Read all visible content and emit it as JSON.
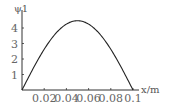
{
  "chart_data": {
    "type": "line",
    "title": "",
    "xlabel": "x/m",
    "ylabel": "ψ1",
    "xlim": [
      0,
      0.1
    ],
    "ylim": [
      0,
      4.6
    ],
    "x_ticks": [
      "0.02",
      "0.04",
      "0.06",
      "0.08",
      "0.1"
    ],
    "y_ticks": [
      "1",
      "2",
      "3",
      "4"
    ],
    "grid": false,
    "legend": null,
    "series": [
      {
        "name": "ψ1",
        "formula": "sqrt(2/0.1)*sin(pi*x/0.1)",
        "x": [
          0,
          0.01,
          0.02,
          0.03,
          0.04,
          0.05,
          0.06,
          0.07,
          0.08,
          0.09,
          0.1
        ],
        "values": [
          0,
          1.38,
          2.63,
          3.62,
          4.25,
          4.47,
          4.25,
          3.62,
          2.63,
          1.38,
          0
        ]
      }
    ]
  }
}
